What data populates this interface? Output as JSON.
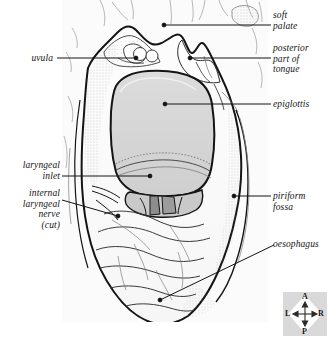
{
  "figure": {
    "background_color": "#ffffff",
    "plate_background": "#fbfbfb",
    "ink_color": "#141414",
    "epiglottis_fill": "#d5d5d5",
    "shadow_fill": "#bdbdbd",
    "dark_opening_fill": "#8d8d8d"
  },
  "labels": {
    "soft_palate": "soft\npalate",
    "posterior_part_of_tongue": "posterior\npart of\ntongue",
    "epiglottis": "epiglottis",
    "piriform_fossa": "piriform\nfossa",
    "oesophagus": "oesophagus",
    "uvula": "uvula",
    "laryngeal_inlet": "laryngeal\ninlet",
    "internal_laryngeal_nerve": "internal\nlaryngeal\nnerve\n(cut)"
  },
  "compass": {
    "anterior": "A",
    "posterior": "P",
    "left": "L",
    "right": "R",
    "panel_color": "#d9d9d9",
    "diamond_color": "#ffffff"
  }
}
